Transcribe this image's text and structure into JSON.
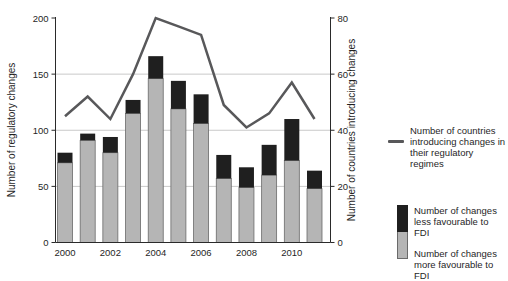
{
  "legend": {
    "line_label": [
      "Number of countries",
      "introducing changes in",
      "their regulatory regimes"
    ],
    "less_label": [
      "Number of changes",
      "less favourable to FDI"
    ],
    "more_label": [
      "Number of changes",
      "more favourable to FDI"
    ]
  },
  "colors": {
    "bar_more_favourable": "#b5b5b5",
    "bar_less_favourable": "#1f1f1f",
    "countries_line": "#58585a",
    "gridline": "#c9c9c9",
    "axis": "#2a2a2a",
    "text": "#1f1f1f"
  },
  "chart_data": {
    "type": "bar",
    "subtype": "stacked-bar-with-line-combo",
    "title": "",
    "categories": [
      "2000",
      "2001",
      "2002",
      "2003",
      "2004",
      "2005",
      "2006",
      "2007",
      "2008",
      "2009",
      "2010",
      "2011"
    ],
    "x_tick_labels_shown": [
      "2000",
      "2002",
      "2004",
      "2006",
      "2008",
      "2010"
    ],
    "x_tick_label_indices": [
      0,
      2,
      4,
      6,
      8,
      10
    ],
    "series": [
      {
        "name": "Number of changes more favourable to FDI",
        "render": "bar-stack-bottom",
        "axis": "left",
        "color": "#b5b5b5",
        "values": [
          71,
          91,
          80,
          115,
          146,
          119,
          106,
          57,
          49,
          60,
          73,
          48
        ]
      },
      {
        "name": "Number of changes less favourable to FDI",
        "render": "bar-stack-top",
        "axis": "left",
        "color": "#1f1f1f",
        "values": [
          9,
          6,
          14,
          12,
          20,
          25,
          26,
          21,
          18,
          27,
          37,
          16
        ]
      },
      {
        "name": "Number of countries introducing changes in their regulatory regimes",
        "render": "line",
        "axis": "right",
        "color": "#58585a",
        "values": [
          45,
          52,
          44,
          60,
          80,
          77,
          74,
          49,
          41,
          46,
          57,
          44
        ]
      }
    ],
    "stacked_totals": [
      80,
      97,
      94,
      127,
      166,
      144,
      132,
      78,
      67,
      87,
      110,
      64
    ],
    "left_axis": {
      "label": "Number of regulatory changes",
      "min": 0,
      "max": 200,
      "ticks": [
        0,
        50,
        100,
        150,
        200
      ]
    },
    "right_axis": {
      "label": "Number of countries introducing changes",
      "min": 0,
      "max": 80,
      "ticks": [
        0,
        20,
        40,
        60,
        80
      ]
    },
    "grid": "horizontal, at left-axis 50/100/150",
    "legend_position": "right"
  }
}
